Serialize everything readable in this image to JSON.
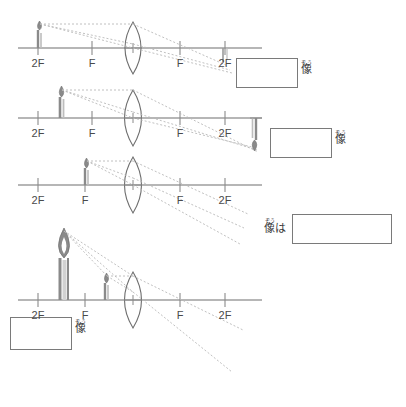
{
  "page": {
    "width": 406,
    "height": 407,
    "background": "#ffffff",
    "line_color": "#6e6e6e",
    "ray_color": "#b9b9b9",
    "candle_color": "#7d7d7d",
    "text_color": "#4a4a4a",
    "box_border": "#7a7a7a"
  },
  "labels": {
    "two_f": "2F",
    "f": "F",
    "image_ruby": "ぞう",
    "image_base": "像",
    "topic_particle": "は"
  },
  "rows": [
    {
      "id": "row-1",
      "axis_y": 48,
      "axis_x1": 18,
      "axis_x2": 262,
      "lens_x": 133,
      "ticks": [
        {
          "x": 38,
          "label": "2F"
        },
        {
          "x": 92,
          "label": "F"
        },
        {
          "x": 180,
          "label": "F"
        },
        {
          "x": 225,
          "label": "2F"
        }
      ],
      "object": {
        "x": 38,
        "height": 22,
        "orientation": "upright",
        "size": "small"
      },
      "image": {
        "x": 225,
        "height": 16,
        "orientation": "inverted",
        "size": "small",
        "drawn": "partial"
      },
      "answer_box": {
        "x": 236,
        "y": 58,
        "w": 62,
        "h": 30
      },
      "answer_label": {
        "x": 302,
        "y": 58,
        "text": "像",
        "ruby": "ぞう",
        "particle": ""
      },
      "answer_value": ""
    },
    {
      "id": "row-2",
      "axis_y": 118,
      "axis_x1": 18,
      "axis_x2": 262,
      "lens_x": 133,
      "ticks": [
        {
          "x": 38,
          "label": "2F"
        },
        {
          "x": 92,
          "label": "F"
        },
        {
          "x": 180,
          "label": "F"
        },
        {
          "x": 225,
          "label": "2F"
        }
      ],
      "object": {
        "x": 60,
        "height": 28,
        "orientation": "upright",
        "size": "medium"
      },
      "image": {
        "x": 256,
        "height": 34,
        "orientation": "inverted",
        "size": "large",
        "drawn": "full"
      },
      "answer_box": {
        "x": 270,
        "y": 128,
        "w": 62,
        "h": 30
      },
      "answer_label": {
        "x": 336,
        "y": 128,
        "text": "像",
        "ruby": "ぞう",
        "particle": ""
      },
      "answer_value": ""
    },
    {
      "id": "row-3",
      "axis_y": 185,
      "axis_x1": 18,
      "axis_x2": 262,
      "lens_x": 133,
      "ticks": [
        {
          "x": 38,
          "label": "2F"
        },
        {
          "x": 85,
          "label": "F"
        },
        {
          "x": 180,
          "label": "F"
        },
        {
          "x": 225,
          "label": "2F"
        }
      ],
      "object": {
        "x": 85,
        "height": 22,
        "orientation": "upright",
        "size": "small"
      },
      "image": {
        "drawn": "none"
      },
      "answer_box": {
        "x": 292,
        "y": 214,
        "w": 100,
        "h": 30
      },
      "answer_label": {
        "x": 264,
        "y": 220,
        "text": "像",
        "ruby": "ぞう",
        "particle": "は"
      },
      "answer_value": ""
    },
    {
      "id": "row-4",
      "axis_y": 300,
      "axis_x1": 18,
      "axis_x2": 262,
      "lens_x": 133,
      "ticks": [
        {
          "x": 38,
          "label": "2F"
        },
        {
          "x": 85,
          "label": "F"
        },
        {
          "x": 180,
          "label": "F"
        },
        {
          "x": 225,
          "label": "2F"
        }
      ],
      "object": {
        "x": 105,
        "height": 22,
        "orientation": "upright",
        "size": "small"
      },
      "image": {
        "x": 60,
        "height": 72,
        "orientation": "upright",
        "size": "large",
        "drawn": "full"
      },
      "answer_box": {
        "x": 10,
        "y": 317,
        "w": 62,
        "h": 33
      },
      "answer_label": {
        "x": 76,
        "y": 317,
        "text": "像",
        "ruby": "ぞう",
        "particle": ""
      },
      "answer_value": ""
    }
  ]
}
